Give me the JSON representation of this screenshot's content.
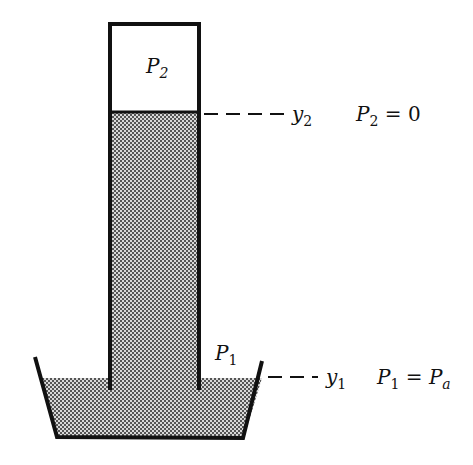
{
  "diagram": {
    "labels": {
      "tube_top_pressure": {
        "main": "P",
        "sub": "2"
      },
      "basin_pressure": {
        "main": "P",
        "sub": "1"
      },
      "level_top": {
        "main": "y",
        "sub": "2"
      },
      "level_bottom": {
        "main": "y",
        "sub": "1"
      },
      "eq_top": {
        "lhs_main": "P",
        "lhs_sub": "2",
        "op": " = ",
        "rhs": "0"
      },
      "eq_bottom": {
        "lhs_main": "P",
        "lhs_sub": "1",
        "op": " = ",
        "rhs_main": "P",
        "rhs_sub": "a"
      }
    },
    "colors": {
      "line": "#111111",
      "liquid_fill": "#9a9a9a",
      "background": "#ffffff"
    }
  }
}
